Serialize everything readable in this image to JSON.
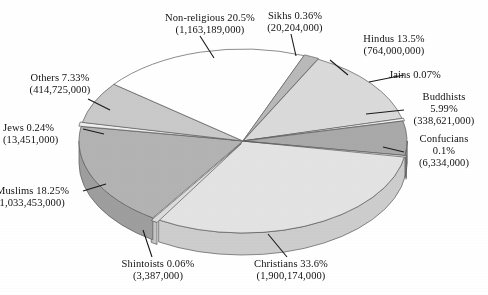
{
  "chart_data": {
    "type": "pie",
    "title": "",
    "subtitle": "",
    "xlabel": "",
    "ylabel": "",
    "legend_position": "callout-labels",
    "grid": false,
    "style": "3d-pie-exploded",
    "value_unit": "adherents",
    "background_color": "#ffffff",
    "text_color": "#111111",
    "outline_color": "#5a5a5a",
    "categories": [
      "Christians",
      "Non-religious",
      "Muslims",
      "Hindus",
      "Others",
      "Buddhists",
      "Sikhs",
      "Jews",
      "Confucians",
      "Jains",
      "Shintoists"
    ],
    "percent": [
      33.6,
      20.5,
      18.25,
      13.5,
      7.33,
      5.99,
      0.36,
      0.24,
      0.1,
      0.07,
      0.06
    ],
    "values": [
      1900174000,
      1163189000,
      1033453000,
      764000000,
      414725000,
      338621000,
      20204000,
      13451000,
      6334000,
      4000000,
      3387000
    ],
    "slices": [
      {
        "name": "Christians",
        "percent_label": "33.6%",
        "value_label": "(1,900,174,000)",
        "label_line1": "Christians 33.6%",
        "label_line2": "(1,900,174,000)",
        "color": "#e3e3e3",
        "side_color": "#cdcdcd",
        "start_deg": 0,
        "sweep_deg": 120.96
      },
      {
        "name": "Shintoists",
        "percent_label": "0.06%",
        "value_label": "(3,387,000)",
        "label_line1": "Shintoists 0.06%",
        "label_line2": "(3,387,000)",
        "color": "#dcdcdc",
        "side_color": "#c4c4c4",
        "start_deg": 120.96,
        "sweep_deg": 2.4
      },
      {
        "name": "Muslims",
        "percent_label": "18.25%",
        "value_label": "(1,033,453,000)",
        "label_line1": "Muslims 18.25%",
        "label_line2": "(1,033,453,000)",
        "color": "#b3b3b3",
        "side_color": "#9e9e9e",
        "start_deg": 123.36,
        "sweep_deg": 65.7
      },
      {
        "name": "Jews",
        "percent_label": "0.24%",
        "value_label": "(13,451,000)",
        "label_line1": "Jews 0.24%",
        "label_line2": "(13,451,000)",
        "color": "#ededed",
        "side_color": "#d6d6d6",
        "start_deg": 189.06,
        "sweep_deg": 2.6
      },
      {
        "name": "Others",
        "percent_label": "7.33%",
        "value_label": "(414,725,000)",
        "label_line1": "Others 7.33%",
        "label_line2": "(414,725,000)",
        "color": "#c9c9c9",
        "side_color": "#b2b2b2",
        "start_deg": 191.66,
        "sweep_deg": 26.4
      },
      {
        "name": "Non-religious",
        "percent_label": "20.5%",
        "value_label": "(1,163,189,000)",
        "label_line1": "Non-religious 20.5%",
        "label_line2": "(1,163,189,000)",
        "color": "#ffffff",
        "side_color": "#ececec",
        "start_deg": 218.06,
        "sweep_deg": 73.8
      },
      {
        "name": "Sikhs",
        "percent_label": "0.36%",
        "value_label": "(20,204,000)",
        "label_line1": "Sikhs 0.36%",
        "label_line2": "(20,204,000)",
        "color": "#b9b9b9",
        "side_color": "#a3a3a3",
        "start_deg": 291.86,
        "sweep_deg": 5.4
      },
      {
        "name": "Hindus",
        "percent_label": "13.5%",
        "value_label": "(764,000,000)",
        "label_line1": "Hindus 13.5%",
        "label_line2": "(764,000,000)",
        "color": "#dadada",
        "side_color": "#c3c3c3",
        "start_deg": 297.26,
        "sweep_deg": 48.6
      },
      {
        "name": "Jains",
        "percent_label": "0.07%",
        "value_label": "",
        "label_line1": "Jains 0.07%",
        "label_line2": "",
        "color": "#f2f2f2",
        "side_color": "#dcdcdc",
        "start_deg": 345.86,
        "sweep_deg": 1.6
      },
      {
        "name": "Buddhists",
        "percent_label": "5.99%",
        "value_label": "(338,621,000)",
        "label_line1": "Buddhists",
        "label_line2": "5.99%",
        "label_line3": "(338,621,000)",
        "color": "#a9a9a9",
        "side_color": "#949494",
        "start_deg": 347.46,
        "sweep_deg": 21.56
      },
      {
        "name": "Confucians",
        "percent_label": "0.1%",
        "value_label": "(6,334,000)",
        "label_line1": "Confucians",
        "label_line2": "0.1%",
        "label_line3": "(6,334,000)",
        "color": "#e8e8e8",
        "side_color": "#d0d0d0",
        "start_deg": 369.02,
        "sweep_deg": 0.98
      }
    ],
    "annotations": [
      "Non-religious 20.5% (1,163,189,000)",
      "Sikhs 0.36% (20,204,000)",
      "Hindus 13.5% (764,000,000)",
      "Jains 0.07%",
      "Buddhists 5.99% (338,621,000)",
      "Confucians 0.1% (6,334,000)",
      "Christians 33.6% (1,900,174,000)",
      "Shintoists 0.06% (3,387,000)",
      "Muslims 18.25% (1,033,453,000)",
      "Jews 0.24% (13,451,000)",
      "Others 7.33% (414,725,000)"
    ]
  },
  "labels": {
    "nonreligious": {
      "l1": "Non-religious 20.5%",
      "l2": "(1,163,189,000)"
    },
    "sikhs": {
      "l1": "Sikhs 0.36%",
      "l2": "(20,204,000)"
    },
    "hindus": {
      "l1": "Hindus 13.5%",
      "l2": "(764,000,000)"
    },
    "jains": {
      "l1": "Jains 0.07%",
      "l2": ""
    },
    "buddhists": {
      "l1": "Buddhists",
      "l2": "5.99%",
      "l3": "(338,621,000)"
    },
    "confucians": {
      "l1": "Confucians",
      "l2": "0.1%",
      "l3": "(6,334,000)"
    },
    "christians": {
      "l1": "Christians 33.6%",
      "l2": "(1,900,174,000)"
    },
    "shintoists": {
      "l1": "Shintoists 0.06%",
      "l2": "(3,387,000)"
    },
    "muslims": {
      "l1": "Muslims 18.25%",
      "l2": "(1,033,453,000)"
    },
    "jews": {
      "l1": "Jews 0.24%",
      "l2": "(13,451,000)"
    },
    "others": {
      "l1": "Others 7.33%",
      "l2": "(414,725,000)"
    }
  }
}
